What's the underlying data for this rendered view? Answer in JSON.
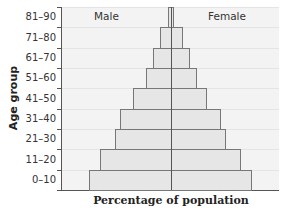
{
  "chart_data": {
    "type": "bar",
    "subtype": "population-pyramid",
    "title": "",
    "xlabel": "Percentage of population",
    "ylabel": "Age group",
    "categories": [
      "0–10",
      "11–20",
      "21–30",
      "31–40",
      "41–50",
      "51–60",
      "61–70",
      "71–80",
      "81–90"
    ],
    "series": [
      {
        "name": "Male",
        "side": "left",
        "values": [
          82,
          71,
          56,
          51,
          38,
          25,
          18,
          11,
          3
        ]
      },
      {
        "name": "Female",
        "side": "right",
        "values": [
          80,
          69,
          54,
          49,
          35,
          25,
          18,
          11,
          2
        ]
      }
    ],
    "value_units": "relative (no numeric x-axis ticks shown)",
    "xlim": [
      -109,
      108
    ],
    "grid": false,
    "legend_position": "top, inside plot (Male left, Female right)",
    "colors": {
      "bar_fill": "#e6e6e6",
      "bar_edge": "#777777",
      "plot_background": "#f3f3f3",
      "axis": "#555555"
    }
  },
  "labels": {
    "male": "Male",
    "female": "Female",
    "xlabel": "Percentage of population",
    "ylabel": "Age group"
  },
  "ticks": [
    "81–90",
    "71–80",
    "61–70",
    "51–60",
    "41–50",
    "31–40",
    "21–30",
    "11–20",
    "0–10"
  ]
}
